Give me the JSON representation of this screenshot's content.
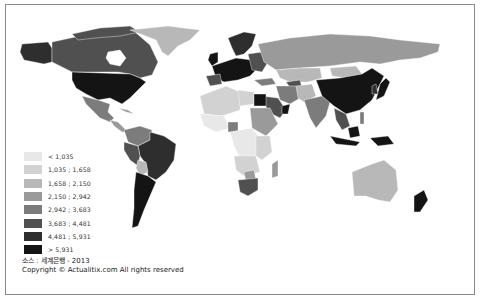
{
  "map": {
    "title": "",
    "palette": {
      "ocean": "#ffffff",
      "border": "#8a8a8a"
    },
    "legend": [
      {
        "label": "< 1,035",
        "color": "#e8e8e8"
      },
      {
        "label": "1,035 ; 1,658",
        "color": "#d2d2d2"
      },
      {
        "label": "1,658 ; 2,150",
        "color": "#b8b8b8"
      },
      {
        "label": "2,150 ; 2,942",
        "color": "#9a9a9a"
      },
      {
        "label": "2,942 ; 3,683",
        "color": "#7c7c7c"
      },
      {
        "label": "3,683 ; 4,481",
        "color": "#505050"
      },
      {
        "label": "4,481 ; 5,931",
        "color": "#2e2e2e"
      },
      {
        "label": "> 5,931",
        "color": "#141414"
      }
    ],
    "source": "소스 : 세계은행 - 2013",
    "copyright": "Copyright © Actualitix.com All rights reserved"
  }
}
